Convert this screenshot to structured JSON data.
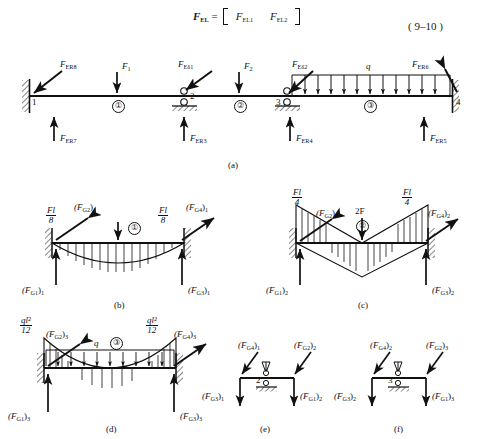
{
  "equation": {
    "lhs_symbol": "F",
    "lhs_sub": "EL",
    "equals": "=",
    "matrix_rows": [
      {
        "symbol": "F",
        "sub": "EL1"
      },
      {
        "symbol": "F",
        "sub": "EL2"
      }
    ],
    "number": "( 9–10 )"
  },
  "figure_a": {
    "caption": "(a)",
    "nodes": [
      "1",
      "2",
      "3",
      "4"
    ],
    "elements": [
      "①",
      "②",
      "③"
    ],
    "distributed_load_symbol": "q",
    "labels": {
      "fer8": {
        "symbol": "F",
        "sub": "ER8"
      },
      "f1": {
        "symbol": "F",
        "sub": "1"
      },
      "fed1": {
        "symbol": "F",
        "sub": "Eδ1"
      },
      "f2": {
        "symbol": "F",
        "sub": "2"
      },
      "fed2": {
        "symbol": "F",
        "sub": "Eδ2"
      },
      "fer6": {
        "symbol": "F",
        "sub": "ER6"
      },
      "fer7": {
        "symbol": "F",
        "sub": "ER7"
      },
      "fer3": {
        "symbol": "F",
        "sub": "ER3"
      },
      "fer4": {
        "symbol": "F",
        "sub": "ER4"
      },
      "fer5": {
        "symbol": "F",
        "sub": "ER5"
      }
    }
  },
  "figure_b": {
    "caption": "(b)",
    "element": "①",
    "moment_left": {
      "num": "Fl",
      "den": "8"
    },
    "moment_right": {
      "num": "Fl",
      "den": "8"
    },
    "labels": {
      "fg2": {
        "symbol": "(F",
        "sub": "G2",
        "tail": ")",
        "idx": "1"
      },
      "fg4": {
        "symbol": "(F",
        "sub": "G4",
        "tail": ")",
        "idx": "1"
      },
      "fg1": {
        "symbol": "(F",
        "sub": "G1",
        "tail": ")",
        "idx": "1"
      },
      "fg3": {
        "symbol": "(F",
        "sub": "G3",
        "tail": ")",
        "idx": "1"
      }
    }
  },
  "figure_c": {
    "caption": "(c)",
    "element": "②",
    "load_label": "2F",
    "moment_left": {
      "num": "Fl",
      "den": "4"
    },
    "moment_right": {
      "num": "Fl",
      "den": "4"
    },
    "labels": {
      "fg2": {
        "symbol": "(F",
        "sub": "G2",
        "tail": ")",
        "idx": "2"
      },
      "fg4": {
        "symbol": "(F",
        "sub": "G4",
        "tail": ")",
        "idx": "2"
      },
      "fg1": {
        "symbol": "(F",
        "sub": "G1",
        "tail": ")",
        "idx": "2"
      },
      "fg3": {
        "symbol": "(F",
        "sub": "G3",
        "tail": ")",
        "idx": "2"
      }
    }
  },
  "figure_d": {
    "caption": "(d)",
    "element": "③",
    "distributed_load_symbol": "q",
    "moment_left": {
      "num": "ql²",
      "den": "12"
    },
    "moment_right": {
      "num": "ql²",
      "den": "12"
    },
    "labels": {
      "fg2": {
        "symbol": "(F",
        "sub": "G2",
        "tail": ")",
        "idx": "3"
      },
      "fg4": {
        "symbol": "(F",
        "sub": "G4",
        "tail": ")",
        "idx": "3"
      },
      "fg1": {
        "symbol": "(F",
        "sub": "G1",
        "tail": ")",
        "idx": "3"
      },
      "fg3": {
        "symbol": "(F",
        "sub": "G3",
        "tail": ")",
        "idx": "3"
      }
    }
  },
  "figure_e": {
    "caption": "(e)",
    "node": "2",
    "labels": {
      "fg4": {
        "symbol": "(F",
        "sub": "G4",
        "tail": ")",
        "idx": "1"
      },
      "fg2": {
        "symbol": "(F",
        "sub": "G2",
        "tail": ")",
        "idx": "2"
      },
      "fg3": {
        "symbol": "(F",
        "sub": "G3",
        "tail": ")",
        "idx": "1"
      },
      "fg1": {
        "symbol": "(F",
        "sub": "G1",
        "tail": ")",
        "idx": "2"
      }
    }
  },
  "figure_f": {
    "caption": "(f)",
    "node": "3",
    "labels": {
      "fg4": {
        "symbol": "(F",
        "sub": "G4",
        "tail": ")",
        "idx": "2"
      },
      "fg2": {
        "symbol": "(F",
        "sub": "G2",
        "tail": ")",
        "idx": "3"
      },
      "fg3": {
        "symbol": "(F",
        "sub": "G3",
        "tail": ")",
        "idx": "2"
      },
      "fg1": {
        "symbol": "(F",
        "sub": "G1",
        "tail": ")",
        "idx": "3"
      }
    }
  },
  "colors": {
    "ink": "#111111",
    "hatch": "#333333",
    "paper": "#ffffff"
  }
}
